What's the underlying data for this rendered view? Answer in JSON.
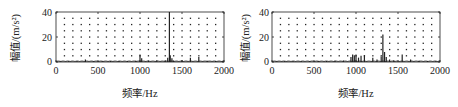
{
  "chart_data": [
    {
      "type": "bar",
      "title": "",
      "xlabel": "频率/Hz",
      "ylabel": "幅值/(m/s²)",
      "xlim": [
        0,
        2000
      ],
      "ylim": [
        0,
        40
      ],
      "xticks": [
        "0",
        "500",
        "1000",
        "1500",
        "2000"
      ],
      "yticks": [
        "0",
        "20",
        "40"
      ],
      "grid": "dotted",
      "legend": null,
      "series": [
        {
          "name": "spectrum",
          "x": [
            50,
            150,
            250,
            350,
            450,
            550,
            650,
            750,
            850,
            950,
            1000,
            1020,
            1100,
            1200,
            1300,
            1330,
            1350,
            1360,
            1380,
            1400,
            1500,
            1600,
            1700,
            1800,
            1900,
            1980
          ],
          "values": [
            0.5,
            0.6,
            0.7,
            2.0,
            0.6,
            0.7,
            0.8,
            0.9,
            0.8,
            1.0,
            6.0,
            3.0,
            1.2,
            1.5,
            1.5,
            3.5,
            40.0,
            5.5,
            3.0,
            1.2,
            1.5,
            3.5,
            4.0,
            1.0,
            0.8,
            0.6
          ]
        }
      ]
    },
    {
      "type": "bar",
      "title": "",
      "xlabel": "频率/Hz",
      "ylabel": "幅值/(m/s²)",
      "xlim": [
        0,
        2000
      ],
      "ylim": [
        0,
        40
      ],
      "xticks": [
        "0",
        "500",
        "1000",
        "1500",
        "2000"
      ],
      "yticks": [
        "0",
        "20",
        "40"
      ],
      "grid": "dotted",
      "legend": null,
      "series": [
        {
          "name": "spectrum",
          "x": [
            50,
            150,
            250,
            350,
            450,
            550,
            650,
            750,
            850,
            940,
            960,
            980,
            1000,
            1030,
            1060,
            1100,
            1200,
            1250,
            1300,
            1320,
            1340,
            1360,
            1400,
            1450,
            1550,
            1650,
            1750,
            1850,
            1950
          ],
          "values": [
            0.5,
            0.6,
            0.6,
            0.7,
            0.7,
            0.8,
            0.8,
            1.0,
            1.2,
            4.0,
            6.0,
            5.5,
            6.0,
            3.5,
            5.0,
            5.5,
            3.5,
            2.0,
            4.5,
            22.0,
            8.0,
            4.0,
            2.0,
            1.5,
            6.0,
            2.0,
            1.0,
            0.8,
            0.6
          ]
        }
      ]
    }
  ],
  "panels": [
    {
      "ylabel": "幅值/(m/s²)",
      "xlabel": "频率/Hz",
      "yticks": [
        "40",
        "20",
        "0"
      ],
      "xticks": [
        "0",
        "500",
        "1000",
        "1500",
        "2000"
      ]
    },
    {
      "ylabel": "幅值/(m/s²)",
      "xlabel": "频率/Hz",
      "yticks": [
        "40",
        "20",
        "0"
      ],
      "xticks": [
        "0",
        "500",
        "1000",
        "1500",
        "2000"
      ]
    }
  ],
  "colors": {
    "axis": "#222222",
    "bar": "#222222",
    "grid_dot": "#222222",
    "background": "#ffffff"
  }
}
